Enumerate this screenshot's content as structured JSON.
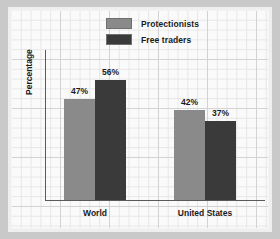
{
  "chart_data": {
    "type": "bar",
    "title": "",
    "xlabel": "",
    "ylabel": "Percentage",
    "ylim": [
      0,
      70
    ],
    "grid": true,
    "legend_position": "top-center",
    "categories": [
      "World",
      "United States"
    ],
    "series": [
      {
        "name": "Protectionists",
        "color": "#8a8a8a",
        "values": [
          47,
          42
        ],
        "value_labels": [
          "47%",
          "42%"
        ]
      },
      {
        "name": "Free traders",
        "color": "#3a3a3a",
        "values": [
          56,
          37
        ],
        "value_labels": [
          "56%",
          "37%"
        ]
      }
    ],
    "bars": [
      {
        "group": "World",
        "series": "Protectionists",
        "value": 47,
        "label": "47%",
        "color": "#8a8a8a"
      },
      {
        "group": "World",
        "series": "Free traders",
        "value": 42,
        "label": "42%",
        "color": "#3a3a3a"
      },
      {
        "group": "United States",
        "series": "Protectionists",
        "value": 56,
        "label": "56%",
        "color": "#8a8a8a"
      },
      {
        "group": "United States",
        "series": "Free traders",
        "value": 37,
        "label": "37%",
        "color": "#3a3a3a"
      }
    ]
  },
  "legend": {
    "items": [
      {
        "label": "Protectionists",
        "color": "#8a8a8a"
      },
      {
        "label": "Free traders",
        "color": "#3a3a3a"
      }
    ]
  },
  "axes": {
    "y_title": "Percentage",
    "categories": [
      {
        "label": "World"
      },
      {
        "label": "United States"
      }
    ]
  },
  "colors": {
    "series_light": "#8a8a8a",
    "series_dark": "#3a3a3a",
    "axis": "#5a5a5a",
    "text": "#1a1a1a",
    "paper": "#fbfbfb",
    "frame": "#c9c9c9"
  }
}
